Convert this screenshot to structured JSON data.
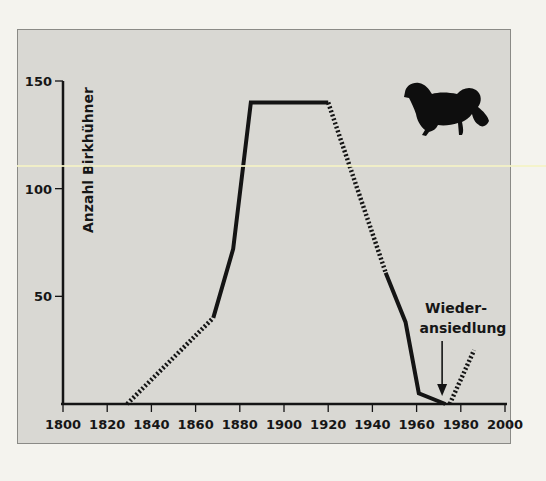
{
  "chart_data": {
    "type": "line",
    "title": "",
    "xlabel": "",
    "ylabel": "Anzahl Birkhühner",
    "xlim": [
      1800,
      2000
    ],
    "ylim": [
      0,
      150
    ],
    "xticks": [
      1800,
      1820,
      1840,
      1860,
      1880,
      1900,
      1920,
      1940,
      1960,
      1980,
      2000
    ],
    "xtick_labels": [
      "1800",
      "1820",
      "1840",
      "1860",
      "1880",
      "1900",
      "1920",
      "1940",
      "1960",
      "1980",
      "2000"
    ],
    "yticks": [
      50,
      100,
      150
    ],
    "ytick_labels": [
      "50",
      "100",
      "150"
    ],
    "grid": false,
    "legend": null,
    "series": [
      {
        "name": "estimated-early",
        "style": "dotted",
        "x": [
          1829,
          1868
        ],
        "y": [
          0,
          40
        ]
      },
      {
        "name": "documented-rise",
        "style": "solid",
        "x": [
          1868,
          1877,
          1885,
          1920
        ],
        "y": [
          40,
          72,
          140,
          140
        ]
      },
      {
        "name": "estimated-decline",
        "style": "dotted",
        "x": [
          1920,
          1946
        ],
        "y": [
          140,
          61
        ]
      },
      {
        "name": "documented-decline",
        "style": "solid",
        "x": [
          1946,
          1955,
          1961,
          1973
        ],
        "y": [
          61,
          38,
          5,
          0
        ]
      },
      {
        "name": "reintroduction",
        "style": "dotted",
        "x": [
          1975,
          1986
        ],
        "y": [
          0,
          25
        ]
      }
    ],
    "annotations": [
      {
        "text_lines": [
          "Wieder-",
          "ansiedlung"
        ],
        "points_to": {
          "x": 1972,
          "y": 0
        },
        "arrow": "down"
      }
    ],
    "line_color": "#141414",
    "background_color": "#d9d8d3"
  },
  "illustration": {
    "icon": "grouse-silhouette-icon"
  }
}
